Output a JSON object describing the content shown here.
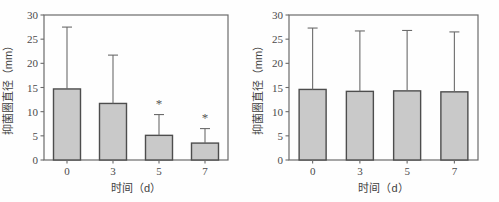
{
  "figure": {
    "background_color": "#fefefe",
    "panel_count": 2
  },
  "chart_data": [
    {
      "id": "left",
      "type": "bar",
      "title": "",
      "xlabel": "时间（d）",
      "ylabel": "抑菌圈直径（mm）",
      "categories": [
        "0",
        "3",
        "5",
        "7"
      ],
      "values": [
        14.7,
        11.7,
        5.1,
        3.5
      ],
      "errors_upper": [
        12.8,
        10.0,
        4.3,
        3.0
      ],
      "error_top_values": [
        27.5,
        21.7,
        9.4,
        6.5
      ],
      "significance_marks": [
        "",
        "",
        "*",
        "*"
      ],
      "ylim": [
        0,
        30
      ],
      "yticks": [
        0,
        5,
        10,
        15,
        20,
        25,
        30
      ],
      "ytick_labels": [
        "0",
        "5",
        "10",
        "15",
        "20",
        "25",
        "30"
      ],
      "grid": false,
      "legend": "none",
      "bar_fill_color": "#c9c9c9",
      "bar_edge_color": "#4d4d4d",
      "error_bar_color": "#6b6b6b",
      "axis_color": "#6b6b6b"
    },
    {
      "id": "right",
      "type": "bar",
      "title": "",
      "xlabel": "时间（d）",
      "ylabel": "抑菌圈直径（mm）",
      "categories": [
        "0",
        "3",
        "5",
        "7"
      ],
      "values": [
        14.6,
        14.2,
        14.3,
        14.1
      ],
      "errors_upper": [
        12.7,
        12.5,
        12.5,
        12.4
      ],
      "error_top_values": [
        27.3,
        26.7,
        26.8,
        26.5
      ],
      "significance_marks": [
        "",
        "",
        "",
        ""
      ],
      "ylim": [
        0,
        30
      ],
      "yticks": [
        0,
        5,
        10,
        15,
        20,
        25,
        30
      ],
      "ytick_labels": [
        "0",
        "5",
        "10",
        "15",
        "20",
        "25",
        "30"
      ],
      "grid": false,
      "legend": "none",
      "bar_fill_color": "#c9c9c9",
      "bar_edge_color": "#4d4d4d",
      "error_bar_color": "#6b6b6b",
      "axis_color": "#6b6b6b"
    }
  ]
}
